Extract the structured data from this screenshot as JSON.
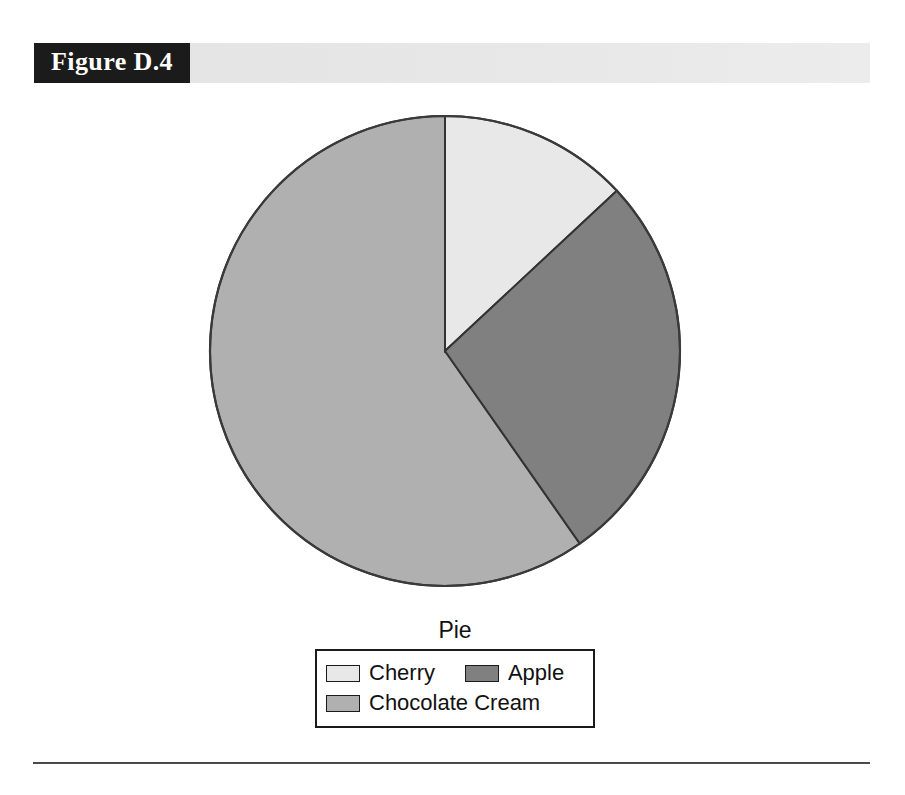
{
  "figure": {
    "label": "Figure D.4"
  },
  "chart_data": {
    "type": "pie",
    "title": "Pie",
    "legend_title": "Pie",
    "legend_position": "bottom",
    "grid": false,
    "start_angle_deg": 0,
    "direction": "clockwise",
    "categories": [
      "Cherry",
      "Apple",
      "Chocolate Cream"
    ],
    "values": [
      13,
      27,
      60
    ],
    "unit": "percent",
    "slices": [
      {
        "label": "Cherry",
        "value": 13,
        "percent": 13,
        "start_angle_deg": 0,
        "end_angle_deg": 47,
        "color": "#e8e8e8"
      },
      {
        "label": "Apple",
        "value": 27,
        "percent": 27,
        "start_angle_deg": 47,
        "end_angle_deg": 145,
        "color": "#808080"
      },
      {
        "label": "Chocolate Cream",
        "value": 60,
        "percent": 60,
        "start_angle_deg": 145,
        "end_angle_deg": 360,
        "color": "#b0b0b0"
      }
    ],
    "xlabel": "",
    "ylabel": ""
  },
  "colors": {
    "header_block_bg": "#1b1b1b",
    "header_band_bg": "#e7e7e7",
    "header_text": "#ffffff",
    "slice_cherry": "#e8e8e8",
    "slice_apple": "#808080",
    "slice_chocolate_cream": "#b0b0b0",
    "outline": "#1a1a1a",
    "rule": "#4a4a4a",
    "page_bg": "#ffffff"
  }
}
